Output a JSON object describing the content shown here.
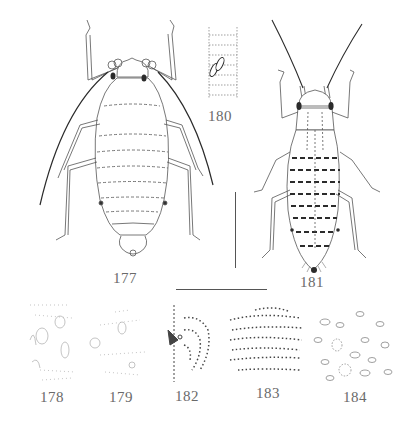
{
  "plate": {
    "description": "Plate of aphid morphology illustrations",
    "figures": [
      {
        "id": "177",
        "label": "177",
        "subject": "apterous aphid, dorsal view (pale, long antennae)"
      },
      {
        "id": "178",
        "label": "178",
        "subject": "dorsal cuticle detail with wax pore plates"
      },
      {
        "id": "179",
        "label": "179",
        "subject": "dorsal cuticle detail with scattered setae"
      },
      {
        "id": "180",
        "label": "180",
        "subject": "antennal segment with secondary rhinaria"
      },
      {
        "id": "181",
        "label": "181",
        "subject": "apterous aphid, dorsal view (dark-banded abdomen)"
      },
      {
        "id": "182",
        "label": "182",
        "subject": "spiracle and surrounding dotted sculpture"
      },
      {
        "id": "183",
        "label": "183",
        "subject": "spinulose dorsal sculpture"
      },
      {
        "id": "184",
        "label": "184",
        "subject": "cuticle with oval wax glands"
      }
    ],
    "scale_bars": [
      {
        "name": "vertical-scale-bar",
        "orientation": "vertical"
      },
      {
        "name": "horizontal-scale-bar",
        "orientation": "horizontal"
      }
    ],
    "colors": {
      "ink": "#2b2b2b",
      "light_ink": "#8a8a8a",
      "label": "#6a6a6a",
      "background": "#ffffff"
    }
  }
}
